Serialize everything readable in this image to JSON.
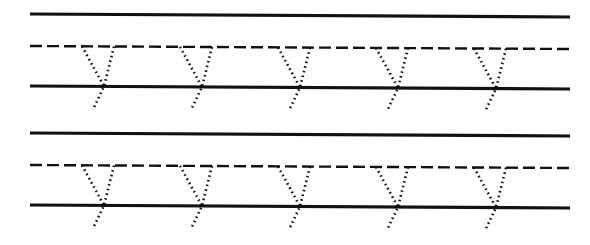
{
  "worksheet": {
    "type": "handwriting-tracing-worksheet",
    "letter": "y",
    "letter_case": "lowercase",
    "background_color": "#ffffff",
    "ink_color": "#111111",
    "canvas": {
      "width": 590,
      "height": 245
    },
    "guide_line_style": {
      "top_line": "solid",
      "middle_line": "dashed",
      "baseline": "solid",
      "dash_pattern": "12 5",
      "solid_stroke_width": 3.2,
      "dashed_stroke_width": 2.4
    },
    "trace_style": {
      "style": "dotted",
      "dash_pattern": "1.6 3.2",
      "stroke_width": 2.6
    },
    "line_slant_px": 3,
    "letters_per_row": 5,
    "letter_spacing_px": 98,
    "letter_width_px": 32,
    "descender_depth_px": 23,
    "rows": [
      {
        "id": "row-1",
        "top_line_y_left": 14,
        "top_line_y_right": 17,
        "mid_line_y_left": 46,
        "mid_line_y_right": 49,
        "baseline_y_left": 86,
        "baseline_y_right": 89,
        "line_x_start": 30,
        "line_x_end": 570,
        "letter_vertices_x": [
          104,
          202,
          300,
          398,
          496
        ]
      },
      {
        "id": "row-2",
        "top_line_y_left": 133,
        "top_line_y_right": 136,
        "mid_line_y_left": 165,
        "mid_line_y_right": 168,
        "baseline_y_left": 205,
        "baseline_y_right": 208,
        "line_x_start": 30,
        "line_x_end": 570,
        "letter_vertices_x": [
          104,
          202,
          300,
          398,
          496
        ]
      }
    ]
  }
}
